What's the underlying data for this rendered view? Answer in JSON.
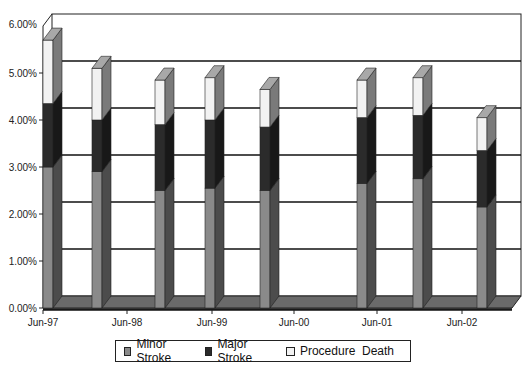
{
  "chart_data": {
    "type": "bar",
    "stacked": true,
    "three_d": true,
    "title": "",
    "xlabel": "",
    "ylabel": "",
    "ylim": [
      0,
      6
    ],
    "y_ticks": [
      "0.00%",
      "1.00%",
      "2.00%",
      "3.00%",
      "4.00%",
      "5.00%",
      "6.00%"
    ],
    "x_tick_labels": [
      "Jun-97",
      "Jun-98",
      "Jun-99",
      "Jun-00",
      "Jun-01",
      "Jun-02"
    ],
    "grid": true,
    "legend_position": "bottom",
    "categories": [
      "~Jun-97",
      "~Jan-98",
      "~Nov-98",
      "~May-99",
      "~Jan-00",
      "~Apr-01",
      "~Nov-01",
      "~Feb-03"
    ],
    "series": [
      {
        "name": "Minor Stroke",
        "color": "#8a8a8a",
        "values": [
          3.0,
          2.9,
          2.5,
          2.55,
          2.5,
          2.65,
          2.75,
          2.15
        ]
      },
      {
        "name": "Major Stroke",
        "color": "#2b2b2b",
        "values": [
          1.35,
          1.1,
          1.4,
          1.45,
          1.35,
          1.4,
          1.35,
          1.2
        ]
      },
      {
        "name": "Procedure  Death",
        "color": "#f2f2f2",
        "values": [
          1.35,
          1.1,
          0.95,
          0.9,
          0.8,
          0.8,
          0.8,
          0.7
        ]
      }
    ],
    "totals": [
      5.7,
      5.1,
      4.85,
      4.9,
      4.65,
      4.85,
      4.9,
      4.05
    ]
  },
  "layout": {
    "bar_x": [
      43,
      92,
      155,
      205,
      260,
      357,
      413,
      477
    ],
    "tick_x": [
      43,
      127,
      212,
      294,
      377,
      462
    ]
  },
  "legend": {
    "items": [
      {
        "label": "Minor Stroke",
        "color": "#8a8a8a"
      },
      {
        "label": "Major Stroke",
        "color": "#2b2b2b"
      },
      {
        "label": "Procedure  Death",
        "color": "#f2f2f2"
      }
    ]
  }
}
